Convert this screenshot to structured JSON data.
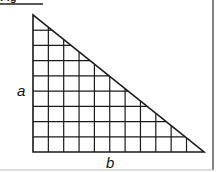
{
  "header": {
    "text": "Fig"
  },
  "diagram": {
    "type": "right-triangle-grid",
    "labels": {
      "vertical_side": "a",
      "horizontal_side": "b"
    },
    "grid": {
      "columns": 11,
      "rows": 9
    },
    "colors": {
      "line": "#1a1a1a",
      "background": "#ffffff",
      "border": "#333333"
    }
  }
}
